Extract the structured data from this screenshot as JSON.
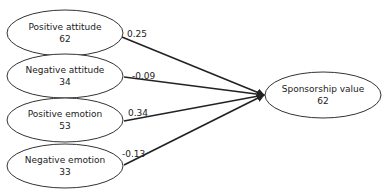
{
  "diagram": {
    "type": "path-model",
    "nodes": [
      {
        "id": "positive_attitude",
        "label": "Positive  attitude",
        "value": "62"
      },
      {
        "id": "negative_attitude",
        "label": "Negative attitude",
        "value": "34"
      },
      {
        "id": "positive_emotion",
        "label": "Positive emotion",
        "value": "53"
      },
      {
        "id": "negative_emotion",
        "label": "Negative emotion",
        "value": "33"
      },
      {
        "id": "sponsorship_value",
        "label": "Sponsorship value",
        "value": "62"
      }
    ],
    "edges": [
      {
        "from": "positive_attitude",
        "to": "sponsorship_value",
        "coefficient": "0.25"
      },
      {
        "from": "negative_attitude",
        "to": "sponsorship_value",
        "coefficient": "-0.09"
      },
      {
        "from": "positive_emotion",
        "to": "sponsorship_value",
        "coefficient": "0.34"
      },
      {
        "from": "negative_emotion",
        "to": "sponsorship_value",
        "coefficient": "-0.13"
      }
    ]
  }
}
